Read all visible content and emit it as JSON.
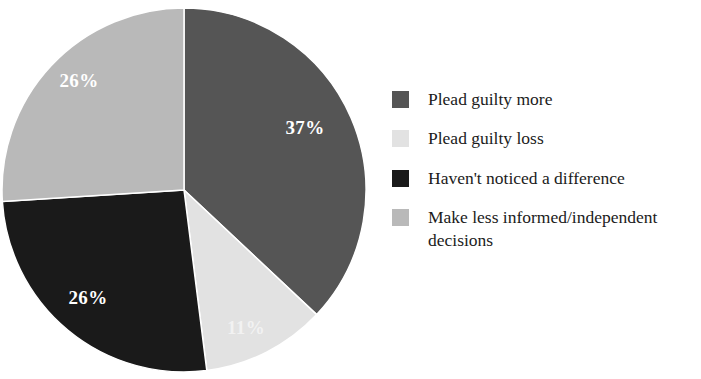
{
  "chart_data": {
    "type": "pie",
    "title": "",
    "subtitle": "",
    "xlabel": "",
    "ylabel": "",
    "grid": false,
    "legend_position": "right",
    "total_label": "100%",
    "start_angle_deg": 0,
    "direction": "clockwise",
    "categories": [
      "Plead guilty more",
      "Plead guilty loss",
      "Haven't noticed a difference",
      "Make less informed/independent decisions"
    ],
    "values": [
      37,
      11,
      26,
      26
    ],
    "value_labels": [
      "37%",
      "11%",
      "26%",
      "26%"
    ],
    "colors": [
      "#555555",
      "#e2e2e2",
      "#1a1a1a",
      "#b9b9b9"
    ],
    "label_text_colors": [
      "#ffffff",
      "#f4f4f4",
      "#ffffff",
      "#ffffff"
    ],
    "slices": [
      {
        "name": "Plead guilty more",
        "value": 37,
        "label": "37%",
        "color": "#555555",
        "label_color": "#ffffff",
        "start_angle_deg": 0,
        "end_angle_deg": 133.2,
        "label_x": 305,
        "label_y": 130
      },
      {
        "name": "Plead guilty loss",
        "value": 11,
        "label": "11%",
        "color": "#e2e2e2",
        "label_color": "#f4f4f4",
        "start_angle_deg": 133.2,
        "end_angle_deg": 172.8,
        "label_x": 246,
        "label_y": 330
      },
      {
        "name": "Haven't noticed a difference",
        "value": 26,
        "label": "26%",
        "color": "#1a1a1a",
        "label_color": "#ffffff",
        "start_angle_deg": 172.8,
        "end_angle_deg": 266.4,
        "label_x": 88,
        "label_y": 300
      },
      {
        "name": "Make less informed/independent decisions",
        "value": 26,
        "label": "26%",
        "color": "#b9b9b9",
        "label_color": "#ffffff",
        "start_angle_deg": 266.4,
        "end_angle_deg": 360,
        "label_x": 79,
        "label_y": 83
      }
    ],
    "geometry": {
      "center_x": 184,
      "center_y": 190,
      "radius": 182
    }
  },
  "legend": {
    "items": [
      {
        "label": "Plead guilty more",
        "color": "#555555"
      },
      {
        "label": "Plead guilty loss",
        "color": "#e2e2e2"
      },
      {
        "label": "Haven't noticed a difference",
        "color": "#1a1a1a"
      },
      {
        "label": "Make less informed/independent\ndecisions",
        "color": "#b9b9b9"
      }
    ]
  }
}
